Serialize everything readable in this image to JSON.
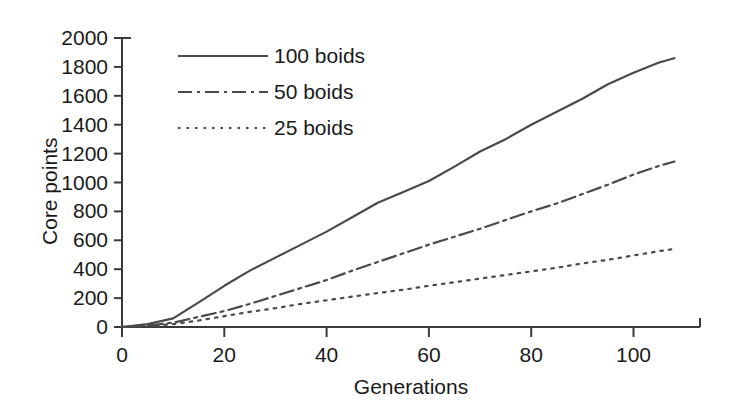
{
  "chart_data": {
    "type": "line",
    "title": "",
    "subtitle": "",
    "xlabel": "Generations",
    "ylabel": "Core points",
    "xlim": [
      0,
      113
    ],
    "ylim": [
      0,
      2000
    ],
    "xticks": [
      0,
      20,
      40,
      60,
      80,
      100
    ],
    "yticks": [
      0,
      200,
      400,
      600,
      800,
      1000,
      1200,
      1400,
      1600,
      1800,
      2000
    ],
    "xtick_labels": [
      "0",
      "20",
      "40",
      "60",
      "80",
      "100"
    ],
    "ytick_labels": [
      "0",
      "200",
      "400",
      "600",
      "800",
      "1000",
      "1200",
      "1400",
      "1600",
      "1800",
      "2000"
    ],
    "grid": false,
    "legend_position": "upper-left-inside",
    "line_color": "#4a4a4a",
    "axis_color": "#3a3a3a",
    "background": "#ffffff",
    "x": [
      0,
      5,
      10,
      15,
      20,
      25,
      30,
      35,
      40,
      45,
      50,
      55,
      60,
      65,
      70,
      75,
      80,
      85,
      90,
      95,
      100,
      105,
      108
    ],
    "series": [
      {
        "name": "100 boids",
        "dash": "solid",
        "values": [
          0,
          20,
          60,
          170,
          285,
          390,
          480,
          570,
          660,
          760,
          860,
          935,
          1010,
          1110,
          1215,
          1300,
          1400,
          1490,
          1580,
          1680,
          1760,
          1830,
          1860
        ]
      },
      {
        "name": "50 boids",
        "dash": "dash-dot",
        "values": [
          0,
          10,
          30,
          70,
          110,
          160,
          215,
          270,
          325,
          390,
          450,
          510,
          570,
          625,
          680,
          740,
          800,
          855,
          920,
          985,
          1055,
          1115,
          1145
        ]
      },
      {
        "name": "25 boids",
        "dash": "dotted",
        "values": [
          0,
          5,
          20,
          45,
          75,
          105,
          130,
          160,
          185,
          210,
          235,
          258,
          285,
          310,
          335,
          360,
          385,
          410,
          440,
          465,
          495,
          525,
          540
        ]
      }
    ],
    "legend": [
      {
        "label": "100 boids",
        "dash": "solid"
      },
      {
        "label": "50 boids",
        "dash": "dash-dot"
      },
      {
        "label": "25 boids",
        "dash": "dotted"
      }
    ]
  }
}
